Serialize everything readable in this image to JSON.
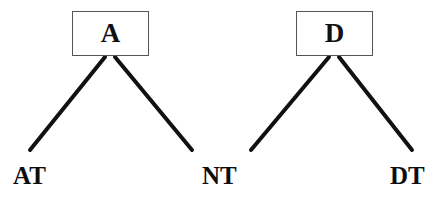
{
  "diagram": {
    "type": "tree",
    "title": "",
    "background_color": "#ffffff",
    "line_color": "#111111",
    "box_border_color": "#555555",
    "text_color": "#0d0d0d",
    "nodes": [
      {
        "id": "A",
        "label": "A",
        "shape": "rectangle",
        "x": 72,
        "y": 11,
        "width": 77,
        "height": 45
      },
      {
        "id": "D",
        "label": "D",
        "shape": "rectangle",
        "x": 296,
        "y": 11,
        "width": 77,
        "height": 45
      }
    ],
    "leaves": [
      {
        "id": "AT",
        "label": "AT",
        "x": 13,
        "y": 163
      },
      {
        "id": "NT",
        "label": "NT",
        "x": 202,
        "y": 163
      },
      {
        "id": "DT",
        "label": "DT",
        "x": 390,
        "y": 163
      }
    ],
    "edges": [
      {
        "from": "A",
        "to": "AT",
        "x1": 105,
        "y1": 57,
        "x2": 30,
        "y2": 150
      },
      {
        "from": "A",
        "to": "NT",
        "x1": 115,
        "y1": 57,
        "x2": 192,
        "y2": 150
      },
      {
        "from": "D",
        "to": "NT",
        "x1": 329,
        "y1": 57,
        "x2": 251,
        "y2": 150
      },
      {
        "from": "D",
        "to": "DT",
        "x1": 339,
        "y1": 57,
        "x2": 412,
        "y2": 150
      }
    ],
    "edge_width": 4
  }
}
